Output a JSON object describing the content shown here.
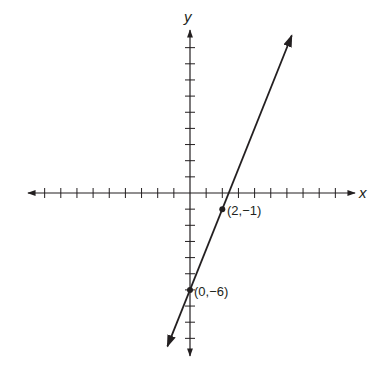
{
  "chart_data": {
    "type": "line",
    "title": "",
    "xlabel": "x",
    "ylabel": "y",
    "xlim": [
      -10,
      10
    ],
    "ylim": [
      -10,
      10
    ],
    "tick_spacing": 1,
    "grid": false,
    "series": [
      {
        "name": "line",
        "equation": "y = 2.5x - 6",
        "slope": 2.5,
        "intercept": -6,
        "x_range": [
          -1.4,
          6.3
        ],
        "color": "#231f20"
      }
    ],
    "points": [
      {
        "x": 2,
        "y": -1,
        "label": "(2,−1)"
      },
      {
        "x": 0,
        "y": -6,
        "label": "(0,−6)"
      }
    ]
  },
  "labels": {
    "x_axis": "x",
    "y_axis": "y",
    "point_a": "(2,−1)",
    "point_b": "(0,−6)"
  },
  "colors": {
    "ink": "#231f20",
    "background": "#ffffff"
  }
}
